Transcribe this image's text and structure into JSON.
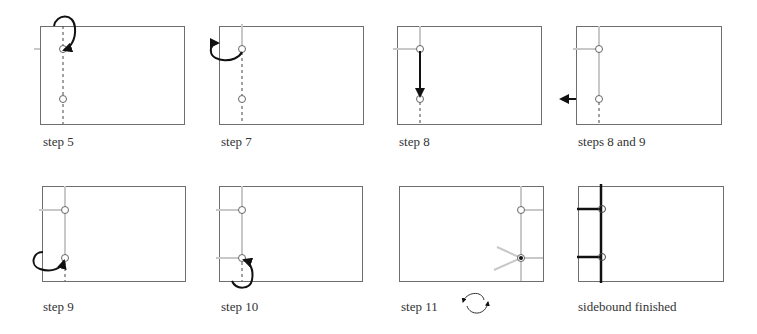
{
  "colors": {
    "frame": "#6e6e6e",
    "thread_active": "#111111",
    "thread_done": "#c8c8c8",
    "hole": "#666666",
    "dashed_guide": "#444444"
  },
  "panels": [
    {
      "id": "step5",
      "label": "step 5"
    },
    {
      "id": "step7",
      "label": "step 7"
    },
    {
      "id": "step8",
      "label": "step 8"
    },
    {
      "id": "steps8and9",
      "label": "steps 8 and  9"
    },
    {
      "id": "step9",
      "label": "step 9"
    },
    {
      "id": "step10",
      "label": "step 10"
    },
    {
      "id": "step11",
      "label": "step 11"
    },
    {
      "id": "finished",
      "label": "sidebound finished"
    }
  ],
  "icons": {
    "step11_rotate": "rotate-arrows-icon"
  }
}
